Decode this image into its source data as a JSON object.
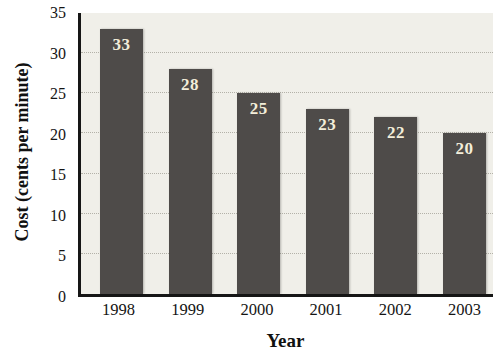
{
  "chart_data": {
    "type": "bar",
    "title": "",
    "categories": [
      "1998",
      "1999",
      "2000",
      "2001",
      "2002",
      "2003"
    ],
    "values": [
      33,
      28,
      25,
      23,
      22,
      20
    ],
    "xlabel": "Year",
    "ylabel": "Cost (cents per minute)",
    "ylim": [
      0,
      35
    ],
    "yticks": [
      0,
      5,
      10,
      15,
      20,
      25,
      30,
      35
    ],
    "gridlines": [
      5,
      10,
      15,
      20,
      25,
      30
    ],
    "grid_style": "dotted",
    "legend_position": "none",
    "colors": {
      "bar_fill": "#4e4b49",
      "bar_value_label": "#f3eeda",
      "plot_background": "#f0efe9",
      "outer_background": "#ffffff",
      "axis_line": "#161616",
      "grid_line": "#b3b1a8",
      "tick_text": "#141414"
    }
  }
}
